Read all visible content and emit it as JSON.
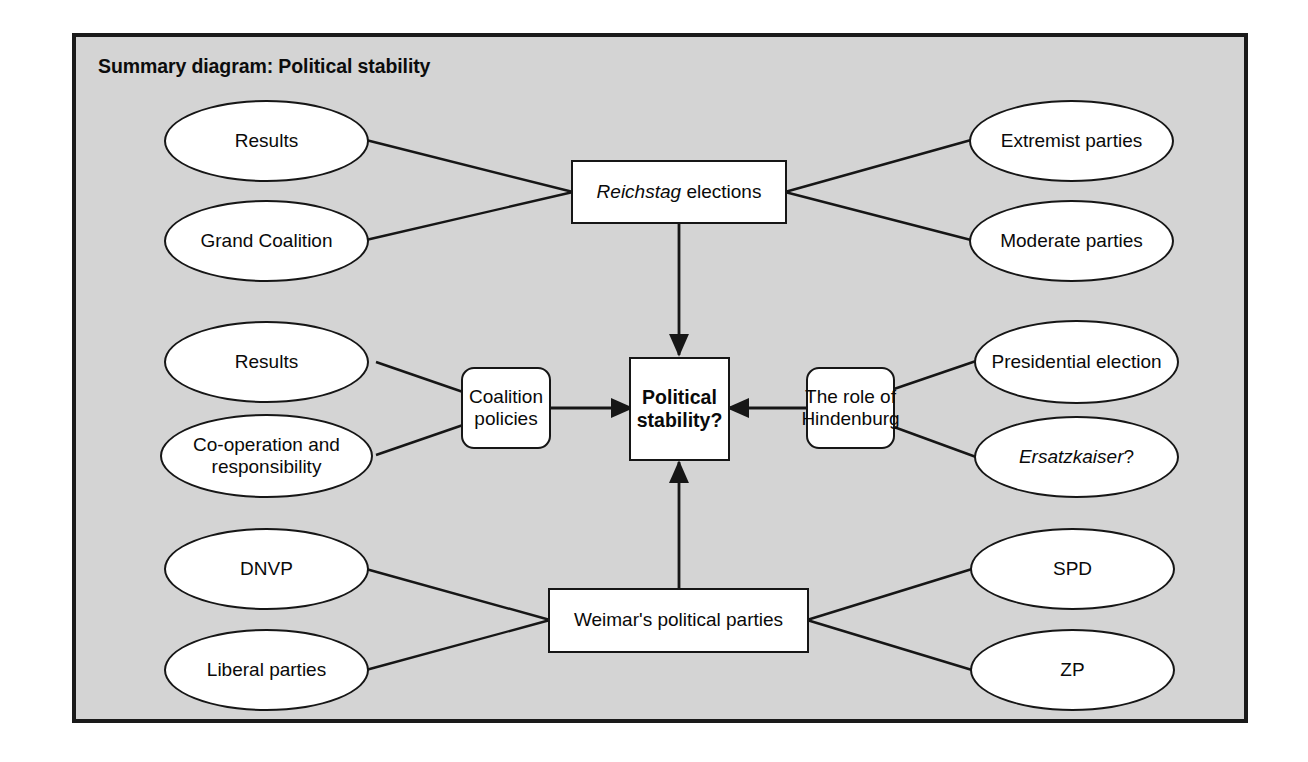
{
  "frame": {
    "title": "Summary diagram: Political stability",
    "background_color": "#d4d4d4",
    "border_color": "#1a1a1a",
    "node_fill": "#ffffff",
    "node_stroke": "#161616"
  },
  "nodes": {
    "results_top": {
      "label": "Results",
      "shape": "oval"
    },
    "grand_coalition": {
      "label": "Grand Coalition",
      "shape": "oval"
    },
    "reichstag_elections": {
      "label_italic": "Reichstag",
      "label_rest": " elections",
      "shape": "rect"
    },
    "extremist_parties": {
      "label": "Extremist parties",
      "shape": "oval"
    },
    "moderate_parties": {
      "label": "Moderate parties",
      "shape": "oval"
    },
    "results_mid": {
      "label": "Results",
      "shape": "oval"
    },
    "cooperation": {
      "label": "Co-operation and responsibility",
      "shape": "oval"
    },
    "coalition_policies": {
      "label": "Coalition policies",
      "shape": "rounded"
    },
    "political_stability": {
      "label": "Political stability?",
      "shape": "rect",
      "bold": true
    },
    "hindenburg": {
      "label": "The role of Hindenburg",
      "shape": "rounded"
    },
    "presidential_election": {
      "label": "Presidential election",
      "shape": "oval"
    },
    "ersatzkaiser": {
      "label_italic": "Ersatzkaiser",
      "label_rest": "?",
      "shape": "oval"
    },
    "dnvp": {
      "label": "DNVP",
      "shape": "oval"
    },
    "liberal_parties": {
      "label": "Liberal parties",
      "shape": "oval"
    },
    "weimar_parties": {
      "label": "Weimar's political parties",
      "shape": "rect"
    },
    "spd": {
      "label": "SPD",
      "shape": "oval"
    },
    "zp": {
      "label": "ZP",
      "shape": "oval"
    }
  },
  "edges": [
    {
      "from": "results_top",
      "to": "reichstag_elections",
      "arrow": false
    },
    {
      "from": "grand_coalition",
      "to": "reichstag_elections",
      "arrow": false
    },
    {
      "from": "reichstag_elections",
      "to": "extremist_parties",
      "arrow": false
    },
    {
      "from": "reichstag_elections",
      "to": "moderate_parties",
      "arrow": false
    },
    {
      "from": "reichstag_elections",
      "to": "political_stability",
      "arrow": true
    },
    {
      "from": "results_mid",
      "to": "coalition_policies",
      "arrow": false
    },
    {
      "from": "cooperation",
      "to": "coalition_policies",
      "arrow": false
    },
    {
      "from": "coalition_policies",
      "to": "political_stability",
      "arrow": true
    },
    {
      "from": "hindenburg",
      "to": "political_stability",
      "arrow": true
    },
    {
      "from": "hindenburg",
      "to": "presidential_election",
      "arrow": false
    },
    {
      "from": "hindenburg",
      "to": "ersatzkaiser",
      "arrow": false
    },
    {
      "from": "dnvp",
      "to": "weimar_parties",
      "arrow": false
    },
    {
      "from": "liberal_parties",
      "to": "weimar_parties",
      "arrow": false
    },
    {
      "from": "weimar_parties",
      "to": "political_stability",
      "arrow": true
    },
    {
      "from": "weimar_parties",
      "to": "spd",
      "arrow": false
    },
    {
      "from": "weimar_parties",
      "to": "zp",
      "arrow": false
    }
  ]
}
